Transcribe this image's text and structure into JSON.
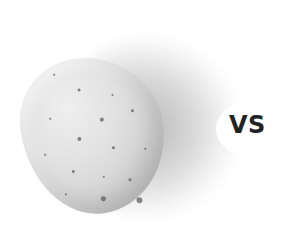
{
  "image": {
    "subject": "potato",
    "background_color": "#ffffff",
    "shadow_color": "#8a8a8a",
    "potato_color": "#dcdcdc"
  },
  "label": {
    "text": "VS",
    "color": "#1e2426"
  },
  "specks": [
    {
      "x": 40,
      "y": 12,
      "s": 2
    },
    {
      "x": 62,
      "y": 30,
      "s": 3
    },
    {
      "x": 95,
      "y": 40,
      "s": 2
    },
    {
      "x": 30,
      "y": 55,
      "s": 2
    },
    {
      "x": 80,
      "y": 62,
      "s": 4
    },
    {
      "x": 112,
      "y": 58,
      "s": 3
    },
    {
      "x": 55,
      "y": 78,
      "s": 4
    },
    {
      "x": 20,
      "y": 90,
      "s": 2
    },
    {
      "x": 88,
      "y": 92,
      "s": 3
    },
    {
      "x": 120,
      "y": 98,
      "s": 2
    },
    {
      "x": 45,
      "y": 110,
      "s": 3
    },
    {
      "x": 75,
      "y": 120,
      "s": 2
    },
    {
      "x": 100,
      "y": 126,
      "s": 3
    },
    {
      "x": 70,
      "y": 140,
      "s": 5
    },
    {
      "x": 105,
      "y": 146,
      "s": 6
    },
    {
      "x": 35,
      "y": 132,
      "s": 2
    }
  ]
}
